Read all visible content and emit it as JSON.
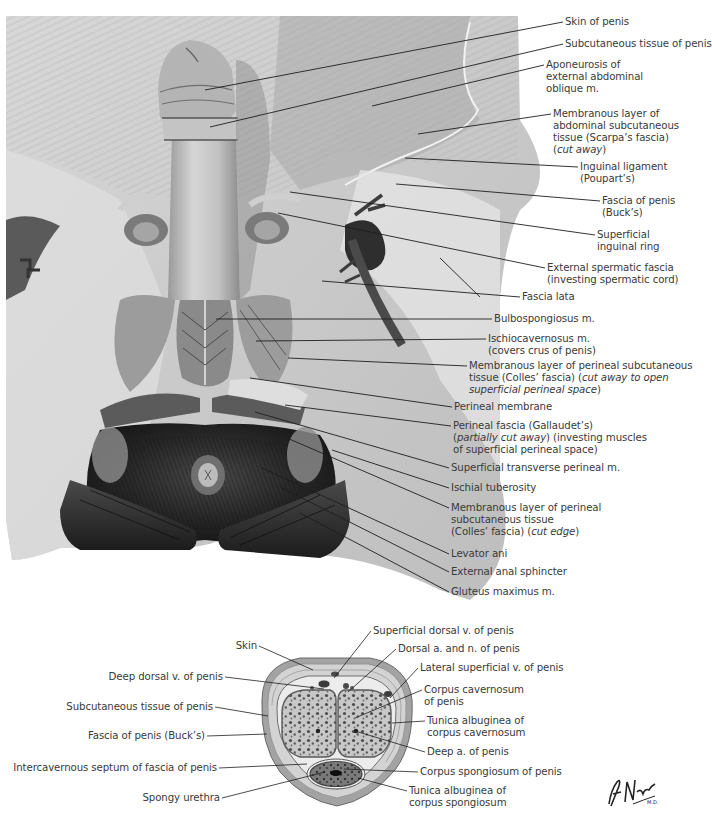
{
  "figure": {
    "palette": {
      "background": "#ffffff",
      "label_text": "#3a3a3a",
      "leader_line": "#1e1e1e",
      "tissue_light": "#e4e4e4",
      "tissue_mid": "#b8b8b8",
      "tissue_dark": "#2a2a2a"
    },
    "main_view": {
      "title": "Perineum and external genitalia (superficial dissection)",
      "labels": [
        {
          "id": "skin-of-penis",
          "lines": [
            "Skin of penis"
          ],
          "x": 565,
          "y": 16,
          "tx": 205,
          "ty": 90,
          "ax": 563,
          "ay": 22
        },
        {
          "id": "subcutaneous-tissue-of-penis",
          "lines": [
            "Subcutaneous tissue of penis"
          ],
          "x": 565,
          "y": 38,
          "tx": 210,
          "ty": 127,
          "ax": 563,
          "ay": 44
        },
        {
          "id": "aponeurosis-external-abdominal-oblique",
          "lines": [
            "Aponeurosis of",
            "external abdominal",
            "oblique m."
          ],
          "x": 546,
          "y": 59,
          "tx": 372,
          "ty": 106,
          "ax": 544,
          "ay": 65
        },
        {
          "id": "scarpas-fascia",
          "lines": [
            "Membranous layer of",
            "abdominal subcutaneous",
            "tissue (Scarpa’s fascia)",
            "(cut away)"
          ],
          "italic_last": true,
          "x": 553,
          "y": 108,
          "tx": 418,
          "ty": 134,
          "ax": 551,
          "ay": 114
        },
        {
          "id": "inguinal-ligament",
          "lines": [
            "Inguinal ligament",
            "(Poupart’s)"
          ],
          "x": 580,
          "y": 161,
          "tx": 405,
          "ty": 158,
          "ax": 578,
          "ay": 167
        },
        {
          "id": "fascia-of-penis-bucks",
          "lines": [
            "Fascia of penis",
            "(Buck’s)"
          ],
          "x": 602,
          "y": 195,
          "tx": 396,
          "ty": 184,
          "ax": 600,
          "ay": 201
        },
        {
          "id": "superficial-inguinal-ring",
          "lines": [
            "Superficial",
            "inguinal ring"
          ],
          "x": 597,
          "y": 229,
          "tx": 290,
          "ty": 192,
          "ax": 595,
          "ay": 235
        },
        {
          "id": "external-spermatic-fascia",
          "lines": [
            "External spermatic fascia",
            "(investing spermatic cord)"
          ],
          "x": 547,
          "y": 262,
          "tx": 278,
          "ty": 213,
          "ax": 545,
          "ay": 268
        },
        {
          "id": "fascia-lata",
          "lines": [
            "Fascia lata"
          ],
          "x": 522,
          "y": 291,
          "tx": 322,
          "ty": 281,
          "ax": 520,
          "ay": 297,
          "tx2": 440,
          "ty2": 258
        },
        {
          "id": "bulbospongiosus",
          "lines": [
            "Bulbospongiosus m."
          ],
          "x": 494,
          "y": 313,
          "tx": 216,
          "ty": 319,
          "ax": 492,
          "ay": 319
        },
        {
          "id": "ischiocavernosus",
          "lines": [
            "Ischiocavernosus m.",
            "(covers crus of penis)"
          ],
          "x": 488,
          "y": 333,
          "tx": 256,
          "ty": 341,
          "ax": 486,
          "ay": 339
        },
        {
          "id": "colles-fascia-cut-away",
          "lines": [
            "Membranous layer of perineal subcutaneous",
            "tissue (Colles’ fascia) (cut away to open",
            "superficial perineal space)"
          ],
          "italic_tail": true,
          "x": 469,
          "y": 360,
          "tx": 288,
          "ty": 358,
          "ax": 467,
          "ay": 366
        },
        {
          "id": "perineal-membrane",
          "lines": [
            "Perineal membrane"
          ],
          "x": 454,
          "y": 401,
          "tx": 250,
          "ty": 378,
          "ax": 452,
          "ay": 407
        },
        {
          "id": "perineal-fascia-gallaudet",
          "lines": [
            "Perineal fascia (Gallaudet’s)",
            "(partially cut away) (investing muscles",
            "of superficial perineal space)"
          ],
          "italic_mid": true,
          "x": 453,
          "y": 420,
          "tx": 285,
          "ty": 405,
          "ax": 451,
          "ay": 426
        },
        {
          "id": "superficial-transverse-perineal",
          "lines": [
            "Superficial transverse perineal m."
          ],
          "x": 451,
          "y": 462,
          "tx": 255,
          "ty": 412,
          "ax": 449,
          "ay": 468
        },
        {
          "id": "ischial-tuberosity",
          "lines": [
            "Ischial tuberosity"
          ],
          "x": 451,
          "y": 482,
          "tx": 332,
          "ty": 450,
          "ax": 449,
          "ay": 488
        },
        {
          "id": "colles-fascia-cut-edge",
          "lines": [
            "Membranous layer of perineal",
            "subcutaneous tissue",
            "(Colles’ fascia) (cut edge)"
          ],
          "italic_edge": true,
          "x": 451,
          "y": 502,
          "tx": 280,
          "ty": 435,
          "ax": 449,
          "ay": 508
        },
        {
          "id": "levator-ani",
          "lines": [
            "Levator ani"
          ],
          "x": 451,
          "y": 548,
          "tx": 262,
          "ty": 468,
          "ax": 449,
          "ay": 554
        },
        {
          "id": "external-anal-sphincter",
          "lines": [
            "External anal sphincter"
          ],
          "x": 451,
          "y": 566,
          "tx": 282,
          "ty": 488,
          "ax": 449,
          "ay": 572
        },
        {
          "id": "gluteus-maximus",
          "lines": [
            "Gluteus maximus m."
          ],
          "x": 451,
          "y": 586,
          "tx": 300,
          "ty": 513,
          "ax": 449,
          "ay": 592
        }
      ]
    },
    "cross_section": {
      "title": "Cross section of penis",
      "left_labels": [
        {
          "id": "skin",
          "text": "Skin",
          "rx": 257,
          "y": 640,
          "tx": 313,
          "ty": 670
        },
        {
          "id": "deep-dorsal-v",
          "text": "Deep dorsal v. of penis",
          "rx": 223,
          "y": 671,
          "tx": 324,
          "ty": 689
        },
        {
          "id": "subcutaneous-tissue",
          "text": "Subcutaneous tissue of penis",
          "rx": 213,
          "y": 701,
          "tx": 268,
          "ty": 716
        },
        {
          "id": "fascia-of-penis",
          "text": "Fascia of penis (Buck’s)",
          "rx": 205,
          "y": 730,
          "tx": 267,
          "ty": 734
        },
        {
          "id": "intercavernous-septum",
          "text": "Intercavernous septum of fascia of penis",
          "rx": 217,
          "y": 762,
          "tx": 307,
          "ty": 764
        },
        {
          "id": "spongy-urethra",
          "text": "Spongy urethra",
          "rx": 220,
          "y": 792,
          "tx": 325,
          "ty": 772
        }
      ],
      "right_labels": [
        {
          "id": "superficial-dorsal-v",
          "lines": [
            "Superficial dorsal v. of penis"
          ],
          "x": 373,
          "y": 625,
          "tx": 334,
          "ty": 678
        },
        {
          "id": "dorsal-a-and-n",
          "lines": [
            "Dorsal a. and n. of penis"
          ],
          "x": 398,
          "y": 643,
          "tx": 348,
          "ty": 692
        },
        {
          "id": "lateral-superficial-v",
          "lines": [
            "Lateral superficial v. of penis"
          ],
          "x": 420,
          "y": 662,
          "tx": 390,
          "ty": 698
        },
        {
          "id": "corpus-cavernosum",
          "lines": [
            "Corpus cavernosum",
            "of penis"
          ],
          "x": 424,
          "y": 684,
          "tx": 355,
          "ty": 718
        },
        {
          "id": "tunica-albuginea-cavernosum",
          "lines": [
            "Tunica albuginea of",
            "corpus cavernosum"
          ],
          "x": 427,
          "y": 715,
          "tx": 392,
          "ty": 723
        },
        {
          "id": "deep-a-of-penis",
          "lines": [
            "Deep a. of penis"
          ],
          "x": 427,
          "y": 746,
          "tx": 355,
          "ty": 731
        },
        {
          "id": "corpus-spongiosum",
          "lines": [
            "Corpus spongiosum of penis"
          ],
          "x": 420,
          "y": 766,
          "tx": 344,
          "ty": 769
        },
        {
          "id": "tunica-albuginea-spongiosum",
          "lines": [
            "Tunica albuginea of",
            "corpus spongiosum"
          ],
          "x": 409,
          "y": 785,
          "tx": 358,
          "ty": 778
        }
      ]
    },
    "signature": "F. Netter M.D."
  }
}
